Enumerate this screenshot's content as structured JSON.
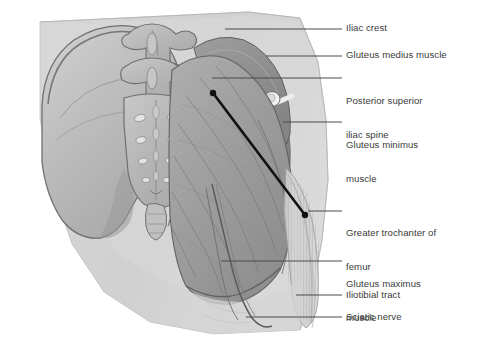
{
  "figure": {
    "view": "posterior-oblique"
  },
  "palette": {
    "background": "#ffffff",
    "skin_silhouette": "#d2d2d2",
    "skin_silhouette_light": "#dcdcdc",
    "bone_fill": "#b8b8b8",
    "bone_light": "#c9c9c9",
    "bone_outline": "#6f6f6f",
    "gluteus_maximus": "#a0a0a0",
    "gluteus_medius": "#8f8f8f",
    "gluteus_minimus": "#7d7d7d",
    "iliotibial_tract": "#cccccc",
    "vessel_white": "#f2f2f2",
    "landmark_line": "#111111",
    "nerve_line": "#555555",
    "label_text": "#3b3b3b",
    "leader_line": "#4a4a4a"
  },
  "labels": [
    {
      "id": "iliac-crest",
      "text": "Iliac crest",
      "lines": [
        "Iliac crest"
      ],
      "text_x": 346,
      "text_y": 22,
      "leader": {
        "x1": 225,
        "y1": 29,
        "x2": 342,
        "y2": 29
      }
    },
    {
      "id": "gluteus-medius-muscle",
      "text": "Gluteus medius muscle",
      "lines": [
        "Gluteus medius muscle"
      ],
      "text_x": 346,
      "text_y": 49,
      "leader": {
        "x1": 266,
        "y1": 56,
        "x2": 342,
        "y2": 56
      }
    },
    {
      "id": "posterior-superior-iliac-spine",
      "text": "Posterior superior iliac spine",
      "lines": [
        "Posterior superior",
        "iliac spine"
      ],
      "text_x": 346,
      "text_y": 72,
      "leader": {
        "x1": 212,
        "y1": 78,
        "x2": 342,
        "y2": 78
      }
    },
    {
      "id": "gluteus-minimus-muscle",
      "text": "Gluteus minimus muscle",
      "lines": [
        "Gluteus minimus",
        "muscle"
      ],
      "text_x": 346,
      "text_y": 116,
      "leader": {
        "x1": 283,
        "y1": 122,
        "x2": 342,
        "y2": 122
      }
    },
    {
      "id": "greater-trochanter-of-femur",
      "text": "Greater trochanter of femur",
      "lines": [
        "Greater trochanter of",
        "femur"
      ],
      "text_x": 346,
      "text_y": 204,
      "leader": {
        "x1": 308,
        "y1": 211,
        "x2": 342,
        "y2": 211
      }
    },
    {
      "id": "gluteus-maximus-muscle",
      "text": "Gluteus maximus muscle",
      "lines": [
        "Gluteus maximus",
        "muscle"
      ],
      "text_x": 346,
      "text_y": 255,
      "leader": {
        "x1": 221,
        "y1": 261,
        "x2": 342,
        "y2": 261
      }
    },
    {
      "id": "iliotibial-tract",
      "text": "Iliotibial tract",
      "lines": [
        "Iliotibial tract"
      ],
      "text_x": 346,
      "text_y": 289,
      "leader": {
        "x1": 296,
        "y1": 295,
        "x2": 342,
        "y2": 295
      }
    },
    {
      "id": "sciatic-nerve",
      "text": "Sciatic nerve",
      "lines": [
        "Sciatic nerve"
      ],
      "text_x": 346,
      "text_y": 311,
      "leader": {
        "x1": 246,
        "y1": 317,
        "x2": 342,
        "y2": 317
      }
    }
  ],
  "landmark_line": {
    "name": "injection-landmark-line",
    "from": {
      "x": 213,
      "y": 93,
      "anchor": "posterior superior iliac spine"
    },
    "to": {
      "x": 305,
      "y": 215,
      "anchor": "greater trochanter of femur"
    },
    "stroke_width": 2.6,
    "endpoint_radius": 3.2
  },
  "structures": [
    {
      "id": "ilium",
      "label": "Ilium / iliac bone"
    },
    {
      "id": "lumbar-vertebrae",
      "label": "Lumbar vertebrae"
    },
    {
      "id": "sacrum",
      "label": "Sacrum"
    },
    {
      "id": "coccyx",
      "label": "Coccyx"
    },
    {
      "id": "gluteus-maximus",
      "label": "Gluteus maximus muscle"
    },
    {
      "id": "gluteus-medius",
      "label": "Gluteus medius muscle"
    },
    {
      "id": "gluteus-minimus",
      "label": "Gluteus minimus muscle"
    },
    {
      "id": "iliotibial-tract",
      "label": "Iliotibial tract"
    },
    {
      "id": "sciatic-nerve",
      "label": "Sciatic nerve"
    },
    {
      "id": "superior-gluteal-vessels",
      "label": "Superior gluteal vessels"
    }
  ]
}
